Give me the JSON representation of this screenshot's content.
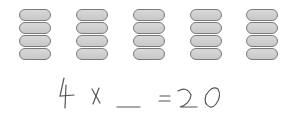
{
  "groups": {
    "count": 5,
    "items_per_group": 4,
    "positions_x": [
      19,
      76,
      133,
      190,
      246
    ]
  },
  "equation": {
    "factor": "4",
    "operator": "×",
    "blank": "___",
    "equals": "=",
    "product": "20",
    "full_text": "4 × ___ = 20"
  },
  "colors": {
    "pill_fill": "#cccccc",
    "pill_border": "#7a7a7a",
    "ink": "#555555"
  }
}
